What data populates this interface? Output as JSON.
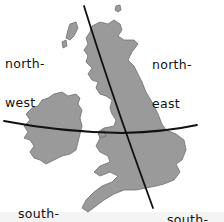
{
  "diagram": {
    "background_color": "#ffffff",
    "land_color": "#9a9a9a",
    "line_color": "#111111",
    "labels": {
      "north_west": {
        "line1": "north-",
        "line2": "west"
      },
      "north_east": {
        "line1": "north-",
        "line2": "east"
      },
      "south_west": {
        "line1": "south-",
        "line2": "west"
      },
      "south_east": {
        "line1": "south-",
        "line2": "east"
      }
    },
    "dividers": {
      "vertical": {
        "from": [
          84,
          6
        ],
        "to": [
          153,
          208
        ]
      },
      "horizontal": {
        "from": [
          4,
          121
        ],
        "via": [
          122,
          133
        ],
        "to": [
          197,
          125
        ]
      }
    }
  }
}
